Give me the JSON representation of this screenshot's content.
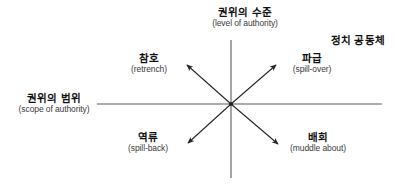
{
  "figure": {
    "title_top_right": "정치 공동체",
    "axes": {
      "vertical": {
        "ko": "권위의 수준",
        "en": "(level of authority)"
      },
      "horizontal": {
        "ko": "권위의 범위",
        "en": "(scope of authority)"
      }
    },
    "quadrants": [
      {
        "id": "retrench",
        "ko": "참호",
        "en": "(retrench)",
        "direction": "upper-left"
      },
      {
        "id": "spill-over",
        "ko": "파급",
        "en": "(spill-over)",
        "direction": "upper-right"
      },
      {
        "id": "spill-back",
        "ko": "역류",
        "en": "(spill-back)",
        "direction": "lower-left"
      },
      {
        "id": "muddle-about",
        "ko": "배회",
        "en": "(muddle about)",
        "direction": "lower-right"
      }
    ],
    "colors": {
      "background": "#ffffff",
      "axis_line": "#5a5a5a",
      "arrow": "#262626",
      "text_primary": "#111111",
      "text_secondary": "#3a3a3a"
    },
    "geometry": {
      "origin_x": 231,
      "origin_y": 104,
      "vertical_axis_top": 40,
      "vertical_axis_bottom": 178,
      "horizontal_axis_left": 97,
      "horizontal_axis_right": 382,
      "arrow_tips": {
        "upper_left": [
          184,
          62
        ],
        "upper_right": [
          279,
          62
        ],
        "lower_left": [
          185,
          146
        ],
        "lower_right": [
          281,
          147
        ]
      }
    }
  }
}
